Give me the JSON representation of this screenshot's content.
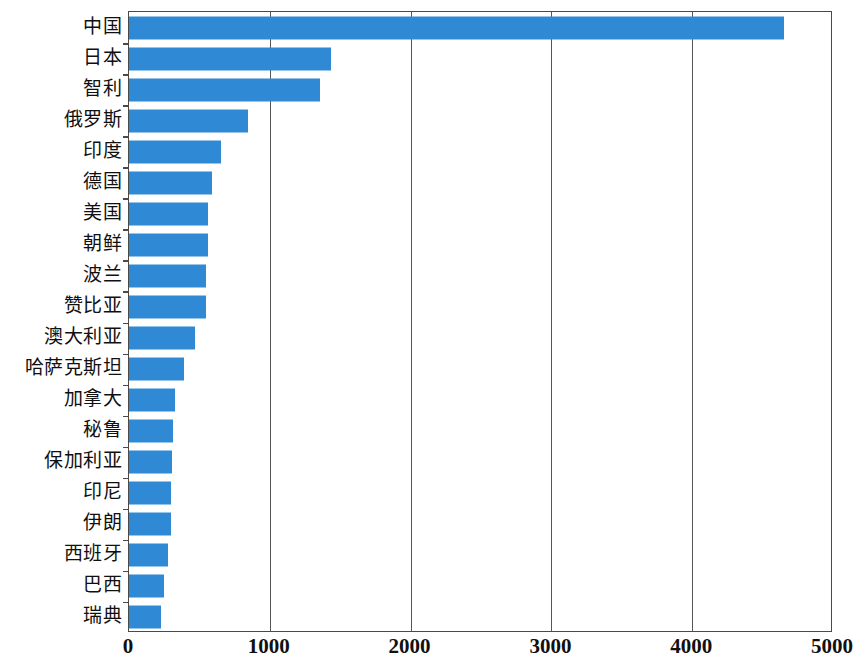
{
  "chart_data": {
    "type": "bar",
    "orientation": "horizontal",
    "title": "",
    "subtitle": "",
    "xlabel": "",
    "ylabel": "",
    "xlim": [
      0,
      5000
    ],
    "ylim": null,
    "grid": true,
    "legend": null,
    "legend_position": "none",
    "xticks": [
      "0",
      "1000",
      "2000",
      "3000",
      "4000",
      "5000"
    ],
    "xtick_values": [
      0,
      1000,
      2000,
      3000,
      4000,
      5000
    ],
    "categories": [
      "中国",
      "日本",
      "智利",
      "俄罗斯",
      "印度",
      "德国",
      "美国",
      "朝鲜",
      "波兰",
      "赞比亚",
      "澳大利亚",
      "哈萨克斯坦",
      "加拿大",
      "秘鲁",
      "保加利亚",
      "印尼",
      "伊朗",
      "西班牙",
      "巴西",
      "瑞典"
    ],
    "values": [
      4650,
      1435,
      1360,
      845,
      655,
      590,
      560,
      560,
      550,
      545,
      470,
      390,
      330,
      315,
      308,
      300,
      295,
      275,
      250,
      230
    ],
    "bar_color": "#3089d4",
    "axis_color": "#4a4a4a",
    "grid_color": "#565656",
    "background_color": "#ffffff"
  }
}
